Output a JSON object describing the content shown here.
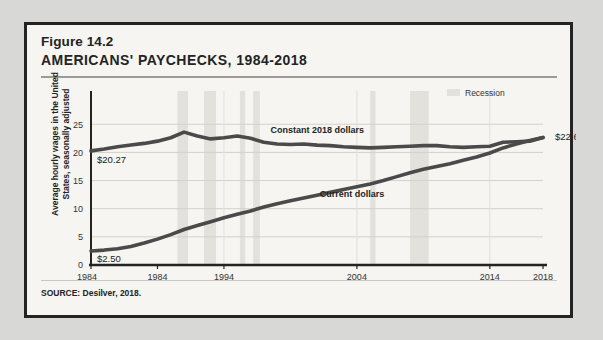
{
  "figure": {
    "number": "Figure 14.2",
    "title": "AMERICANS' PAYCHECKS, 1984-2018",
    "source": "SOURCE: Desilver, 2018."
  },
  "legend": {
    "recession_label": "Recession",
    "recession_color": "#e2e1dc"
  },
  "chart_data": {
    "type": "line",
    "title": "AMERICANS' PAYCHECKS, 1984-2018",
    "xlabel": "",
    "ylabel": "Average hourly wages in the United States, seasonally adjusted",
    "xlim": [
      1984,
      2018
    ],
    "ylim": [
      0,
      27
    ],
    "yticks": [
      "0",
      "5",
      "10",
      "15",
      "20",
      "25"
    ],
    "ytick_values": [
      0,
      5,
      10,
      15,
      20,
      25
    ],
    "xticks": [
      "1984",
      "1984",
      "1994",
      "2004",
      "2014",
      "2018"
    ],
    "xtick_values": [
      1984,
      1989,
      1994,
      2004,
      2014,
      2018
    ],
    "grid": true,
    "legend_position": "top-right",
    "annotations": {
      "start_constant": "$20.27",
      "start_current": "$2.50",
      "end_value": "$22.65"
    },
    "series": [
      {
        "name": "Constant 2018 dollars",
        "color": "#4a4a4a",
        "x": [
          1984,
          1985,
          1986,
          1987,
          1988,
          1989,
          1990,
          1991,
          1992,
          1993,
          1994,
          1995,
          1996,
          1997,
          1998,
          1999,
          2000,
          2001,
          2002,
          2003,
          2004,
          2005,
          2006,
          2007,
          2008,
          2009,
          2010,
          2011,
          2012,
          2013,
          2014,
          2015,
          2016,
          2017,
          2018
        ],
        "values": [
          20.27,
          20.6,
          21.0,
          21.3,
          21.6,
          22.0,
          22.6,
          23.6,
          22.9,
          22.4,
          22.6,
          22.9,
          22.5,
          21.8,
          21.5,
          21.4,
          21.5,
          21.3,
          21.2,
          21.0,
          20.9,
          20.8,
          20.9,
          21.0,
          21.1,
          21.2,
          21.2,
          21.0,
          20.9,
          21.0,
          21.1,
          21.8,
          21.9,
          22.0,
          22.65
        ]
      },
      {
        "name": "Current dollars",
        "color": "#4a4a4a",
        "x": [
          1984,
          1985,
          1986,
          1987,
          1988,
          1989,
          1990,
          1991,
          1992,
          1993,
          1994,
          1995,
          1996,
          1997,
          1998,
          1999,
          2000,
          2001,
          2002,
          2003,
          2004,
          2005,
          2006,
          2007,
          2008,
          2009,
          2010,
          2011,
          2012,
          2013,
          2014,
          2015,
          2016,
          2017,
          2018
        ],
        "values": [
          2.5,
          2.65,
          2.9,
          3.3,
          3.9,
          4.6,
          5.4,
          6.3,
          7.0,
          7.7,
          8.4,
          9.0,
          9.6,
          10.3,
          10.9,
          11.4,
          11.9,
          12.4,
          12.9,
          13.4,
          13.9,
          14.4,
          15.0,
          15.7,
          16.4,
          17.0,
          17.5,
          18.0,
          18.6,
          19.2,
          19.9,
          20.8,
          21.5,
          22.1,
          22.65
        ]
      }
    ],
    "recession_bands": [
      {
        "start": 1990.5,
        "end": 1991.3
      },
      {
        "start": 1992.5,
        "end": 1993.4
      },
      {
        "start": 1995.2,
        "end": 1995.6
      },
      {
        "start": 1996.2,
        "end": 1996.7
      },
      {
        "start": 2005.0,
        "end": 2005.4
      },
      {
        "start": 2008.0,
        "end": 2009.4
      }
    ]
  }
}
